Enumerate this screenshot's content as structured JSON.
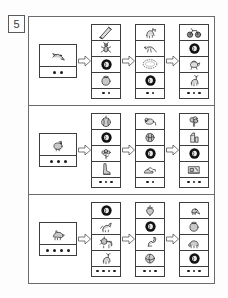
{
  "exercise": {
    "number": "5"
  },
  "legend": {
    "dot_color": "#1c1c1c",
    "border_color": "#3d3d3d",
    "frame_color": "#6b6b6b"
  },
  "rows": [
    {
      "id": "row-1",
      "prompt": {
        "picture": "bird-flying-icon",
        "dots": 2
      },
      "columns": [
        {
          "id": "row1-col1",
          "cells": [
            "pencil-icon",
            "insect-icon",
            "dark-ring-icon",
            "tomato-icon"
          ],
          "dots": 2
        },
        {
          "id": "row1-col2",
          "cells": [
            "cat-icon",
            "pheasant-bird-icon",
            "oval-wreath-icon",
            "dark-ring-icon"
          ],
          "dots": 2
        },
        {
          "id": "row1-col3",
          "cells": [
            "motorcycle-icon",
            "dark-ring-icon",
            "teapot-icon",
            "deer-icon"
          ],
          "dots": 3
        }
      ]
    },
    {
      "id": "row-2",
      "prompt": {
        "picture": "hen-icon",
        "dots": 3
      },
      "columns": [
        {
          "id": "row2-col1",
          "cells": [
            "pumpkin-icon",
            "dark-ring-icon",
            "flower-icon",
            "boot-icon"
          ],
          "dots": 3
        },
        {
          "id": "row2-col2",
          "cells": [
            "mouse-icon",
            "cabbage-icon",
            "dark-ring-icon",
            "shoes-icon"
          ],
          "dots": 2
        },
        {
          "id": "row2-col3",
          "cells": [
            "broccoli-icon",
            "milk-carton-icon",
            "dark-ring-icon",
            "sewing-machine-icon"
          ],
          "dots": 3
        }
      ]
    },
    {
      "id": "row-3",
      "prompt": {
        "picture": "boar-icon",
        "dots": 4
      },
      "columns": [
        {
          "id": "row3-col1",
          "cells": [
            "dark-ring-icon",
            "horse-icon",
            "lion-icon",
            "deer-icon"
          ],
          "dots": 4
        },
        {
          "id": "row3-col2",
          "cells": [
            "strawberry-icon",
            "dark-ring-icon",
            "squirrel-icon",
            "ball-icon"
          ],
          "dots": 3
        },
        {
          "id": "row3-col3",
          "cells": [
            "bird-perched-icon",
            "tomato-icon",
            "elephant-icon",
            "dark-ring-icon"
          ],
          "dots": 3
        }
      ]
    }
  ]
}
